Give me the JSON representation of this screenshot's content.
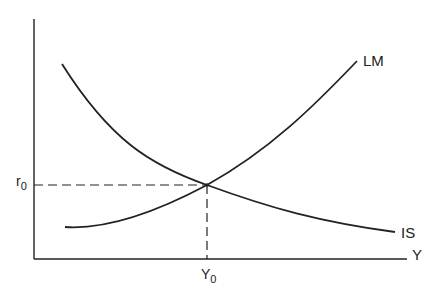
{
  "diagram": {
    "curves": [
      {
        "name": "LM",
        "label": "LM",
        "shape": "upward-sloping convex"
      },
      {
        "name": "IS",
        "label": "IS",
        "shape": "downward-sloping convex"
      }
    ],
    "axes": {
      "x_label": "Y",
      "y_label": ""
    },
    "equilibrium": {
      "r_label_main": "r",
      "r_label_sub": "0",
      "y_label_main": "Y",
      "y_label_sub": "0"
    },
    "colors": {
      "line": "#222222",
      "background": "#ffffff"
    }
  }
}
